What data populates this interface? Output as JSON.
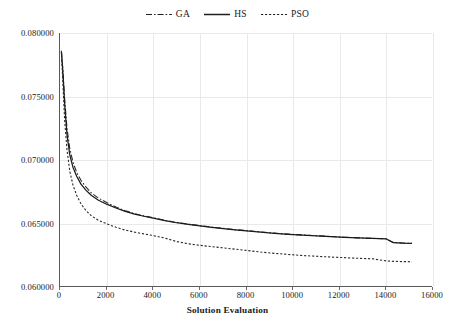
{
  "chart_data": {
    "type": "line",
    "title": "",
    "xlabel": "Solution Evaluation",
    "ylabel": "",
    "xlim": [
      0,
      16000
    ],
    "ylim": [
      0.06,
      0.08
    ],
    "grid": true,
    "legend_position": "top-center",
    "xticks": [
      0,
      2000,
      4000,
      6000,
      8000,
      10000,
      12000,
      14000,
      16000
    ],
    "xtick_labels": [
      "0",
      "2000",
      "4000",
      "6000",
      "8000",
      "10000",
      "12000",
      "14000",
      "16000"
    ],
    "yticks": [
      0.06,
      0.065,
      0.07,
      0.075,
      0.08
    ],
    "ytick_labels": [
      "0.060000",
      "0.065000",
      "0.070000",
      "0.075000",
      "0.080000"
    ],
    "series": [
      {
        "name": "GA",
        "style": "dash-dot",
        "color": "#2b2b2b",
        "x": [
          60,
          120,
          200,
          300,
          420,
          560,
          720,
          900,
          1100,
          1350,
          1650,
          2000,
          2400,
          2800,
          3200,
          3600,
          4000,
          4500,
          5000,
          5500,
          6000,
          6500,
          7000,
          7500,
          8000,
          8600,
          9200,
          9800,
          10400,
          11000,
          11600,
          12200,
          12800,
          13400,
          14000,
          14300,
          14700,
          15100
        ],
        "y": [
          0.0786,
          0.0772,
          0.0748,
          0.0725,
          0.0709,
          0.0698,
          0.069,
          0.0684,
          0.0679,
          0.0674,
          0.067,
          0.06665,
          0.0663,
          0.066,
          0.06578,
          0.0656,
          0.06545,
          0.06525,
          0.06508,
          0.06495,
          0.06483,
          0.06472,
          0.06462,
          0.06452,
          0.06444,
          0.06434,
          0.06424,
          0.06416,
          0.0641,
          0.06404,
          0.06398,
          0.06392,
          0.06387,
          0.06383,
          0.06379,
          0.0635,
          0.06346,
          0.06344
        ]
      },
      {
        "name": "HS",
        "style": "solid",
        "color": "#1a1a1a",
        "x": [
          60,
          120,
          200,
          300,
          420,
          560,
          720,
          900,
          1100,
          1350,
          1650,
          2000,
          2400,
          2800,
          3200,
          3600,
          4000,
          4500,
          5000,
          5500,
          6000,
          6500,
          7000,
          7500,
          8000,
          8600,
          9200,
          9800,
          10400,
          11000,
          11600,
          12200,
          12800,
          13400,
          14000,
          14300,
          14700,
          15100
        ],
        "y": [
          0.07855,
          0.077,
          0.0744,
          0.072,
          0.0704,
          0.0694,
          0.0687,
          0.0681,
          0.06765,
          0.0672,
          0.06683,
          0.06652,
          0.06622,
          0.06595,
          0.06574,
          0.06557,
          0.06543,
          0.06523,
          0.06506,
          0.06493,
          0.06481,
          0.0647,
          0.0646,
          0.0645,
          0.06442,
          0.06432,
          0.06423,
          0.06415,
          0.06409,
          0.06403,
          0.06397,
          0.06391,
          0.06386,
          0.06382,
          0.06378,
          0.06349,
          0.06345,
          0.06343
        ]
      },
      {
        "name": "PSO",
        "style": "dotted",
        "color": "#2b2b2b",
        "x": [
          60,
          120,
          200,
          300,
          420,
          560,
          720,
          900,
          1100,
          1350,
          1650,
          2000,
          2400,
          2800,
          3200,
          3600,
          4000,
          4500,
          5000,
          5500,
          6000,
          6500,
          7000,
          7500,
          8000,
          8600,
          9200,
          9800,
          10400,
          11000,
          11600,
          12200,
          12800,
          13400,
          14000,
          14300,
          14700,
          15100
        ],
        "y": [
          0.0785,
          0.0762,
          0.0731,
          0.0708,
          0.0691,
          0.068,
          0.0672,
          0.06655,
          0.06605,
          0.0656,
          0.06525,
          0.06498,
          0.0647,
          0.06448,
          0.06432,
          0.06418,
          0.06405,
          0.06385,
          0.06358,
          0.0634,
          0.06328,
          0.06318,
          0.06308,
          0.06298,
          0.06288,
          0.06275,
          0.06265,
          0.06256,
          0.06248,
          0.06242,
          0.06236,
          0.06231,
          0.06226,
          0.06222,
          0.06205,
          0.06202,
          0.062,
          0.06199
        ]
      }
    ]
  },
  "legend": {
    "items": [
      {
        "label": "GA",
        "style": "dash-dot"
      },
      {
        "label": "HS",
        "style": "solid"
      },
      {
        "label": "PSO",
        "style": "dotted"
      }
    ]
  },
  "axis": {
    "x_title": "Solution Evaluation"
  }
}
